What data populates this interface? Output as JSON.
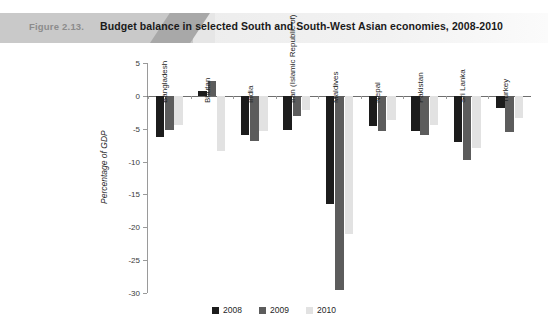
{
  "header": {
    "figure_label": "Figure 2.13.",
    "title": "Budget balance in selected South and South-West Asian economies, 2008-2010"
  },
  "chart_data": {
    "type": "bar",
    "title": "Budget balance in selected South and South-West Asian economies, 2008-2010",
    "xlabel": "",
    "ylabel": "Percentage of GDP",
    "ylim": [
      -30,
      5
    ],
    "yticks": [
      5,
      0,
      -5,
      -10,
      -15,
      -20,
      -25,
      -30
    ],
    "ytick_labels": [
      "5",
      "0",
      "-5",
      "-10",
      "-15",
      "-20",
      "-25",
      "-30"
    ],
    "grid": false,
    "legend_position": "bottom",
    "categories": [
      "Bangladesh",
      "Bhutan",
      "India",
      "Iran (Islamic Republic of)",
      "Maldives",
      "Nepal",
      "Pakistan",
      "Sri Lanka",
      "Turkey"
    ],
    "series": [
      {
        "name": "2008",
        "color": "#1c1c1c",
        "values": [
          -6.3,
          0.8,
          -6.0,
          -5.2,
          -16.5,
          -4.6,
          -5.3,
          -7.0,
          -1.8
        ]
      },
      {
        "name": "2009",
        "color": "#5c5c5c",
        "values": [
          -5.2,
          2.2,
          -6.8,
          -3.0,
          -29.5,
          -5.3,
          -6.0,
          -9.8,
          -5.5
        ]
      },
      {
        "name": "2010",
        "color": "#e2e2e2",
        "values": [
          -4.5,
          -8.4,
          -5.4,
          -2.2,
          -21.0,
          -3.6,
          -4.4,
          -8.0,
          -3.3
        ]
      }
    ]
  },
  "legend": {
    "items": [
      {
        "label": "2008",
        "color": "#1c1c1c"
      },
      {
        "label": "2009",
        "color": "#5c5c5c"
      },
      {
        "label": "2010",
        "color": "#e2e2e2"
      }
    ]
  }
}
